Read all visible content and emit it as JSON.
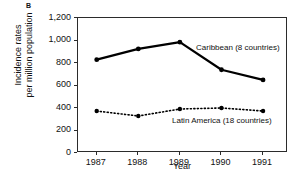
{
  "panel": {
    "label": "B"
  },
  "chart_data": {
    "type": "line",
    "title": "",
    "subtitle": "",
    "xlabel": "Year",
    "ylabel_line1": "Incidence rates",
    "ylabel_line2": "per million population",
    "categories": [
      "1987",
      "1988",
      "1989",
      "1990",
      "1991"
    ],
    "x": [
      1987,
      1988,
      1989,
      1990,
      1991
    ],
    "xlim": [
      1986.55,
      1991.6
    ],
    "ylim": [
      0,
      1200
    ],
    "yticks": [
      0,
      200,
      400,
      600,
      800,
      1000,
      1200
    ],
    "ytick_labels": [
      "0",
      "200",
      "400",
      "600",
      "800",
      "1,000",
      "1,200"
    ],
    "grid": false,
    "legend_position": "inline-annotation",
    "series": [
      {
        "name": "Caribbean (8 countries)",
        "values": [
          830,
          925,
          985,
          740,
          650
        ],
        "line_style": "solid",
        "line_width": 2.2,
        "marker": "circle",
        "color": "#000000"
      },
      {
        "name": "Latin America (18 countries)",
        "values": [
          373,
          329,
          391,
          400,
          373
        ],
        "line_style": "dotted",
        "line_width": 1.6,
        "marker": "circle",
        "color": "#000000"
      }
    ],
    "annotations": [
      {
        "text": "Caribbean (8 countries)",
        "series": 0
      },
      {
        "text": "Latin America (18 countries)",
        "series": 1
      }
    ]
  },
  "colors": {
    "axis": "#2b2b2b",
    "series": "#000000",
    "background": "#ffffff",
    "text": "#111111"
  }
}
